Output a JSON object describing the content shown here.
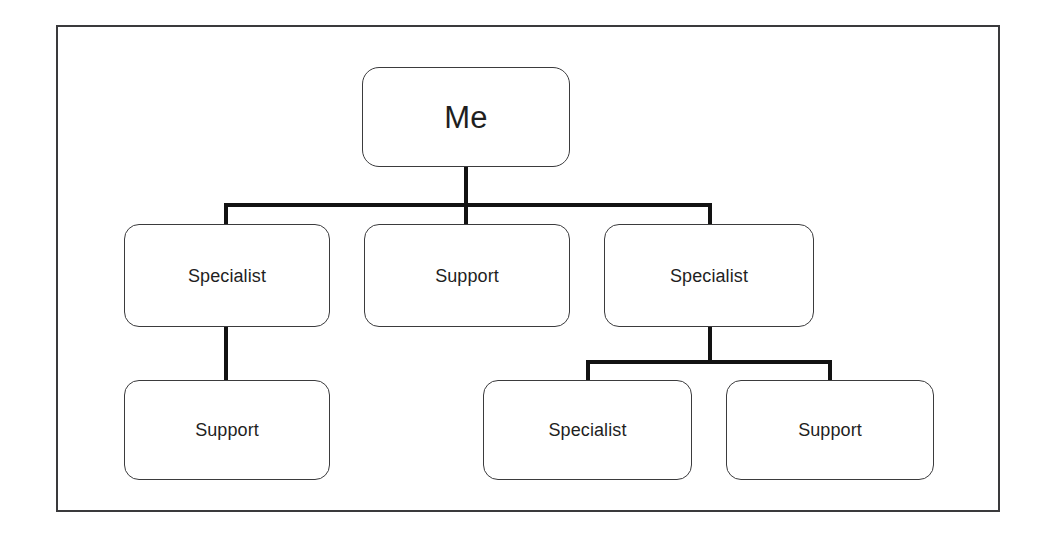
{
  "diagram": {
    "type": "organization-chart",
    "title": "",
    "background_color": "#ffffff",
    "frame": {
      "border_color": "#3a3a3c",
      "fill_color": "#ffffff"
    },
    "style": {
      "node_border_color": "#3b3b3d",
      "node_fill_color": "#ffffff",
      "connector_color": "#121212",
      "text_color": "#1f1f1f"
    },
    "nodes": [
      {
        "id": "root",
        "label": "Me",
        "level": 1,
        "role": "root"
      },
      {
        "id": "spec-left",
        "label": "Specialist",
        "level": 2,
        "role": "specialist"
      },
      {
        "id": "sup-mid",
        "label": "Support",
        "level": 2,
        "role": "support"
      },
      {
        "id": "spec-right",
        "label": "Specialist",
        "level": 2,
        "role": "specialist"
      },
      {
        "id": "sup-left",
        "label": "Support",
        "level": 3,
        "role": "support"
      },
      {
        "id": "spec-bot",
        "label": "Specialist",
        "level": 3,
        "role": "specialist"
      },
      {
        "id": "sup-bot",
        "label": "Support",
        "level": 3,
        "role": "support"
      }
    ],
    "edges": [
      {
        "from": "root",
        "to": "spec-left"
      },
      {
        "from": "root",
        "to": "sup-mid"
      },
      {
        "from": "root",
        "to": "spec-right"
      },
      {
        "from": "spec-left",
        "to": "sup-left"
      },
      {
        "from": "spec-right",
        "to": "spec-bot"
      },
      {
        "from": "spec-right",
        "to": "sup-bot"
      }
    ]
  }
}
